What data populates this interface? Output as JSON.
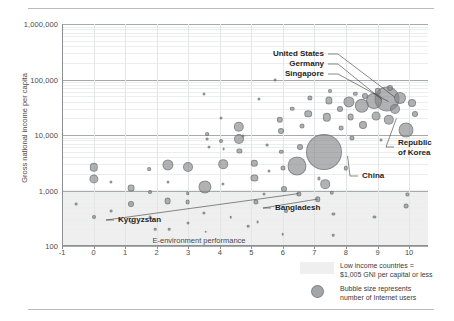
{
  "chart_data": {
    "type": "scatter",
    "title": "",
    "xlabel": "E-environment performance",
    "ylabel": "Gross national income per capita",
    "xlim": [
      -1,
      10.6
    ],
    "ylim": [
      100,
      1000000
    ],
    "yscale": "log",
    "grid": true,
    "legend_position": "bottom-right",
    "bubble_meaning": "Bubble size represents number of Internet users",
    "xticks": [
      "-1",
      "0",
      "1",
      "2",
      "3",
      "4",
      "5",
      "6",
      "7",
      "8",
      "9",
      "10"
    ],
    "xtick_values": [
      -1,
      0,
      1,
      2,
      3,
      4,
      5,
      6,
      7,
      8,
      9,
      10
    ],
    "yticks": [
      "100",
      "1,000",
      "10,000",
      "100,000",
      "1,000,000"
    ],
    "ytick_values": [
      100,
      1000,
      10000,
      100000,
      1000000
    ],
    "shaded_band": {
      "label": "Low income countries = $1,005 GNI per capital or less",
      "y_max": 1005,
      "y_min": 100,
      "color": "#efefef"
    },
    "annotations": [
      {
        "label": "United States",
        "x": 9.55,
        "y": 48000
      },
      {
        "label": "Germany",
        "x": 9.15,
        "y": 43000
      },
      {
        "label": "Singapore",
        "x": 9.35,
        "y": 40000
      },
      {
        "label": "Republic of Korea",
        "x": 9.6,
        "y": 20000
      },
      {
        "label": "China",
        "x": 8.05,
        "y": 4200
      },
      {
        "label": "Bangladesh",
        "x": 7.1,
        "y": 700
      },
      {
        "label": "Kyrgyzstan",
        "x": 6.5,
        "y": 880
      }
    ],
    "points": [
      {
        "x": 0.0,
        "y": 2600,
        "r": 4.2
      },
      {
        "x": 0.0,
        "y": 1600,
        "r": 4.6
      },
      {
        "x": 0.0,
        "y": 330,
        "r": 2.0
      },
      {
        "x": -0.55,
        "y": 560,
        "r": 1.4
      },
      {
        "x": 0.55,
        "y": 1450,
        "r": 1.6
      },
      {
        "x": 0.55,
        "y": 420,
        "r": 1.4
      },
      {
        "x": 1.2,
        "y": 1100,
        "r": 3.4
      },
      {
        "x": 1.2,
        "y": 560,
        "r": 3.0
      },
      {
        "x": 1.2,
        "y": 270,
        "r": 1.5
      },
      {
        "x": 1.75,
        "y": 2400,
        "r": 1.9
      },
      {
        "x": 1.78,
        "y": 930,
        "r": 2.0
      },
      {
        "x": 1.8,
        "y": 330,
        "r": 1.4
      },
      {
        "x": 2.35,
        "y": 2900,
        "r": 5.6
      },
      {
        "x": 2.35,
        "y": 640,
        "r": 3.4
      },
      {
        "x": 2.35,
        "y": 1400,
        "r": 1.5
      },
      {
        "x": 2.98,
        "y": 2700,
        "r": 5.0
      },
      {
        "x": 2.98,
        "y": 610,
        "r": 2.4
      },
      {
        "x": 2.98,
        "y": 900,
        "r": 1.8
      },
      {
        "x": 3.0,
        "y": 260,
        "r": 1.5
      },
      {
        "x": 3.52,
        "y": 1150,
        "r": 6.6
      },
      {
        "x": 3.5,
        "y": 55000,
        "r": 1.5
      },
      {
        "x": 3.5,
        "y": 400,
        "r": 1.6
      },
      {
        "x": 3.55,
        "y": 180,
        "r": 1.3
      },
      {
        "x": 3.6,
        "y": 10500,
        "r": 1.9
      },
      {
        "x": 3.6,
        "y": 8400,
        "r": 1.4
      },
      {
        "x": 3.65,
        "y": 6000,
        "r": 1.5
      },
      {
        "x": 4.05,
        "y": 20000,
        "r": 1.5
      },
      {
        "x": 4.05,
        "y": 7800,
        "r": 2.0
      },
      {
        "x": 4.1,
        "y": 3000,
        "r": 4.8
      },
      {
        "x": 4.1,
        "y": 1300,
        "r": 1.6
      },
      {
        "x": 4.12,
        "y": 5600,
        "r": 1.4
      },
      {
        "x": 4.6,
        "y": 14000,
        "r": 5.2
      },
      {
        "x": 4.6,
        "y": 8600,
        "r": 5.0
      },
      {
        "x": 4.62,
        "y": 5200,
        "r": 2.6
      },
      {
        "x": 4.75,
        "y": 9600,
        "r": 1.5
      },
      {
        "x": 5.1,
        "y": 3100,
        "r": 3.2
      },
      {
        "x": 5.1,
        "y": 1700,
        "r": 3.6
      },
      {
        "x": 5.15,
        "y": 620,
        "r": 2.6
      },
      {
        "x": 5.2,
        "y": 270,
        "r": 1.4
      },
      {
        "x": 5.25,
        "y": 45000,
        "r": 1.6
      },
      {
        "x": 5.4,
        "y": 860,
        "r": 1.5
      },
      {
        "x": 5.5,
        "y": 6500,
        "r": 1.4
      },
      {
        "x": 5.55,
        "y": 2200,
        "r": 1.5
      },
      {
        "x": 5.9,
        "y": 19000,
        "r": 3.2
      },
      {
        "x": 5.95,
        "y": 12000,
        "r": 3.0
      },
      {
        "x": 5.95,
        "y": 5000,
        "r": 2.2
      },
      {
        "x": 6.0,
        "y": 2500,
        "r": 2.5
      },
      {
        "x": 6.05,
        "y": 1050,
        "r": 3.0
      },
      {
        "x": 6.1,
        "y": 430,
        "r": 2.0
      },
      {
        "x": 6.3,
        "y": 30000,
        "r": 2.3
      },
      {
        "x": 6.45,
        "y": 2800,
        "r": 9.5
      },
      {
        "x": 6.5,
        "y": 880,
        "r": 2.6
      },
      {
        "x": 6.55,
        "y": 6200,
        "r": 3.0
      },
      {
        "x": 6.6,
        "y": 14500,
        "r": 2.5
      },
      {
        "x": 6.8,
        "y": 24000,
        "r": 3.8
      },
      {
        "x": 6.85,
        "y": 46000,
        "r": 2.6
      },
      {
        "x": 7.1,
        "y": 700,
        "r": 2.8
      },
      {
        "x": 7.15,
        "y": 1650,
        "r": 1.6
      },
      {
        "x": 7.3,
        "y": 5000,
        "r": 18.0
      },
      {
        "x": 7.35,
        "y": 1300,
        "r": 4.8
      },
      {
        "x": 7.4,
        "y": 21000,
        "r": 4.2
      },
      {
        "x": 7.45,
        "y": 42000,
        "r": 3.6
      },
      {
        "x": 7.48,
        "y": 62000,
        "r": 2.0
      },
      {
        "x": 7.55,
        "y": 900,
        "r": 2.2
      },
      {
        "x": 7.6,
        "y": 380,
        "r": 1.6
      },
      {
        "x": 7.8,
        "y": 30000,
        "r": 3.0
      },
      {
        "x": 7.85,
        "y": 13500,
        "r": 2.4
      },
      {
        "x": 8.0,
        "y": 2500,
        "r": 2.2
      },
      {
        "x": 8.1,
        "y": 40000,
        "r": 5.6
      },
      {
        "x": 8.15,
        "y": 21000,
        "r": 3.4
      },
      {
        "x": 8.2,
        "y": 9000,
        "r": 2.6
      },
      {
        "x": 8.3,
        "y": 55000,
        "r": 2.2
      },
      {
        "x": 8.5,
        "y": 34000,
        "r": 7.2
      },
      {
        "x": 8.55,
        "y": 15000,
        "r": 4.0
      },
      {
        "x": 8.6,
        "y": 50000,
        "r": 3.0
      },
      {
        "x": 8.9,
        "y": 41000,
        "r": 8.0
      },
      {
        "x": 8.95,
        "y": 22000,
        "r": 4.4
      },
      {
        "x": 9.0,
        "y": 61000,
        "r": 3.2
      },
      {
        "x": 9.1,
        "y": 8000,
        "r": 1.5
      },
      {
        "x": 9.3,
        "y": 45000,
        "r": 12.5
      },
      {
        "x": 9.35,
        "y": 19000,
        "r": 5.2
      },
      {
        "x": 9.4,
        "y": 70000,
        "r": 3.0
      },
      {
        "x": 9.55,
        "y": 30000,
        "r": 5.0
      },
      {
        "x": 9.7,
        "y": 47000,
        "r": 6.0
      },
      {
        "x": 9.9,
        "y": 12500,
        "r": 7.5
      },
      {
        "x": 10.1,
        "y": 38000,
        "r": 4.0
      },
      {
        "x": 10.2,
        "y": 24000,
        "r": 3.0
      },
      {
        "x": 2.4,
        "y": 200,
        "r": 1.3
      },
      {
        "x": 4.9,
        "y": 230,
        "r": 1.3
      },
      {
        "x": 6.0,
        "y": 165,
        "r": 1.3
      },
      {
        "x": 7.6,
        "y": 155,
        "r": 1.3
      },
      {
        "x": 8.9,
        "y": 330,
        "r": 1.6
      },
      {
        "x": 9.9,
        "y": 520,
        "r": 2.4
      },
      {
        "x": 9.95,
        "y": 850,
        "r": 1.6
      },
      {
        "x": 5.75,
        "y": 96000,
        "r": 1.4
      },
      {
        "x": 4.35,
        "y": 330,
        "r": 1.3
      },
      {
        "x": 1.95,
        "y": 200,
        "r": 1.3
      }
    ]
  },
  "legend": {
    "band_line1": "Low income countries =",
    "band_line2": "$1,005 GNI per capital or less",
    "bubble_line1": "Bubble size represents",
    "bubble_line2": "number of Internet users"
  }
}
